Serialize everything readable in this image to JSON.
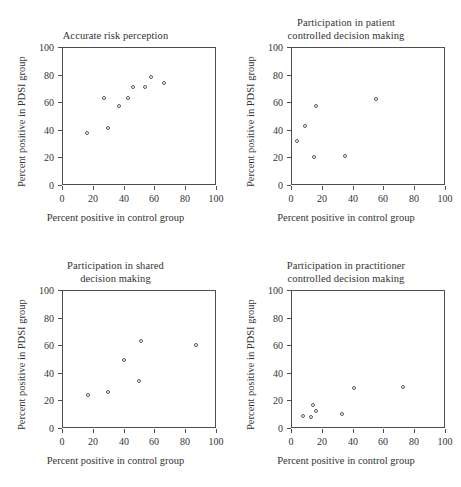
{
  "figure": {
    "width": 461,
    "height": 487,
    "background": "#ffffff",
    "marker_color": "#5a5a5a",
    "axis_color": "#4d4d4d",
    "text_color": "#333333",
    "layout": "2x2 grid of scatter plots"
  },
  "axis_labels": {
    "x": "Percent positive in control group",
    "y": "Percent positive in PDSI group"
  },
  "ticks": {
    "x": [
      "0",
      "20",
      "40",
      "60",
      "80",
      "100"
    ],
    "y": [
      "0",
      "20",
      "40",
      "60",
      "80",
      "100"
    ]
  },
  "chart_data": [
    {
      "type": "scatter",
      "title": "Accurate risk perception",
      "title_lines": [
        "Accurate risk perception"
      ],
      "xlabel": "Percent positive in control group",
      "ylabel": "Percent positive in PDSI group",
      "xlim": [
        0,
        100
      ],
      "ylim": [
        0,
        100
      ],
      "xticks": [
        0,
        20,
        40,
        60,
        80,
        100
      ],
      "yticks": [
        0,
        20,
        40,
        60,
        80,
        100
      ],
      "grid": false,
      "legend": "none",
      "points": [
        {
          "x": 16,
          "y": 38
        },
        {
          "x": 27,
          "y": 63
        },
        {
          "x": 30,
          "y": 41
        },
        {
          "x": 37,
          "y": 57
        },
        {
          "x": 43,
          "y": 63
        },
        {
          "x": 46,
          "y": 71
        },
        {
          "x": 54,
          "y": 71
        },
        {
          "x": 58,
          "y": 78
        },
        {
          "x": 66,
          "y": 74
        }
      ]
    },
    {
      "type": "scatter",
      "title": "Participation in patient controlled decision making",
      "title_lines": [
        "Participation in patient",
        "controlled decision making"
      ],
      "xlabel": "Percent positive in control group",
      "ylabel": "Percent positive in PDSI group",
      "xlim": [
        0,
        100
      ],
      "ylim": [
        0,
        100
      ],
      "xticks": [
        0,
        20,
        40,
        60,
        80,
        100
      ],
      "yticks": [
        0,
        20,
        40,
        60,
        80,
        100
      ],
      "grid": false,
      "legend": "none",
      "points": [
        {
          "x": 4,
          "y": 32
        },
        {
          "x": 9,
          "y": 43
        },
        {
          "x": 15,
          "y": 20
        },
        {
          "x": 16,
          "y": 57
        },
        {
          "x": 35,
          "y": 21
        },
        {
          "x": 55,
          "y": 62
        }
      ]
    },
    {
      "type": "scatter",
      "title": "Participation in shared decision making",
      "title_lines": [
        "Participation in shared",
        "decision making"
      ],
      "xlabel": "Percent positive in control group",
      "ylabel": "Percent positive in PDSI group",
      "xlim": [
        0,
        100
      ],
      "ylim": [
        0,
        100
      ],
      "xticks": [
        0,
        20,
        40,
        60,
        80,
        100
      ],
      "yticks": [
        0,
        20,
        40,
        60,
        80,
        100
      ],
      "grid": false,
      "legend": "none",
      "points": [
        {
          "x": 17,
          "y": 24
        },
        {
          "x": 30,
          "y": 26
        },
        {
          "x": 40,
          "y": 49
        },
        {
          "x": 50,
          "y": 34
        },
        {
          "x": 51,
          "y": 63
        },
        {
          "x": 87,
          "y": 60
        }
      ]
    },
    {
      "type": "scatter",
      "title": "Participation in practitioner controlled decision making",
      "title_lines": [
        "Participation in practitioner",
        "controlled decision making"
      ],
      "xlabel": "Percent positive in control group",
      "ylabel": "Percent positive in PDSI group",
      "xlim": [
        0,
        100
      ],
      "ylim": [
        0,
        100
      ],
      "xticks": [
        0,
        20,
        40,
        60,
        80,
        100
      ],
      "yticks": [
        0,
        20,
        40,
        60,
        80,
        100
      ],
      "grid": false,
      "legend": "none",
      "points": [
        {
          "x": 8,
          "y": 9
        },
        {
          "x": 13,
          "y": 8
        },
        {
          "x": 14,
          "y": 17
        },
        {
          "x": 16,
          "y": 12
        },
        {
          "x": 33,
          "y": 10
        },
        {
          "x": 41,
          "y": 29
        },
        {
          "x": 73,
          "y": 30
        }
      ]
    }
  ]
}
